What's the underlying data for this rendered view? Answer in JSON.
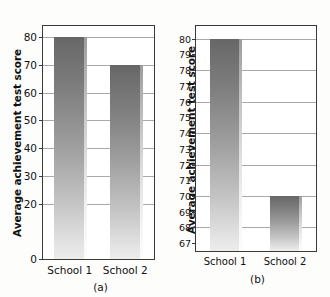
{
  "figure": {
    "background": "#fdfdfc",
    "bar_color_top": "#676767",
    "bar_color_bottom": "#ececec",
    "frame_color": "#3a3a3a",
    "gridline_color": "#9a9a9a"
  },
  "chart_data": [
    {
      "type": "bar",
      "panel": "a",
      "caption": "(a)",
      "title": "",
      "xlabel": "",
      "ylabel": "Average achievement test score",
      "categories": [
        "School 1",
        "School 2"
      ],
      "values": [
        80,
        70
      ],
      "ylim": [
        0,
        84
      ],
      "yticks": [
        0,
        20,
        30,
        40,
        50,
        60,
        70,
        80
      ],
      "ytick_labels": [
        "0",
        "20",
        "30",
        "40",
        "50",
        "60",
        "70",
        "80"
      ],
      "grid": true,
      "legend": "none",
      "baseline": 0
    },
    {
      "type": "bar",
      "panel": "b",
      "caption": "(b)",
      "title": "",
      "xlabel": "",
      "ylabel": "Average achievement test score",
      "categories": [
        "School 1",
        "School 2"
      ],
      "values": [
        80,
        70
      ],
      "ylim": [
        66.5,
        80.8
      ],
      "yticks": [
        67,
        68,
        69,
        70,
        71,
        72,
        73,
        74,
        75,
        76,
        77,
        78,
        79,
        80
      ],
      "ytick_labels": [
        "67",
        "68",
        "69",
        "70",
        "71",
        "72",
        "73",
        "74",
        "75",
        "76",
        "77",
        "78",
        "79",
        "80"
      ],
      "gridlines_at": [
        68,
        70,
        72,
        74,
        76,
        78,
        80
      ],
      "grid": true,
      "legend": "none",
      "baseline": 66.5
    }
  ]
}
